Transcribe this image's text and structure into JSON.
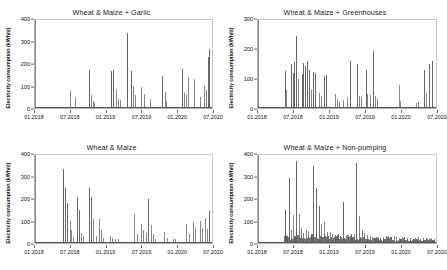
{
  "figure": {
    "background_color": "#ffffff",
    "series_color": "#5e5e5e",
    "axis_color": "#666666",
    "panel_count": 4
  },
  "chart_data": [
    {
      "type": "bar",
      "panel": "top-left",
      "title": "Wheat & Maize + Garlic",
      "xlabel": "",
      "ylabel": "Electricity consumption (kWh/d)",
      "ylim": [
        0,
        400
      ],
      "yticks": [
        0,
        100,
        200,
        300,
        400
      ],
      "xticks": [
        "01.2018",
        "07.2018",
        "01.2019",
        "07.2019",
        "01.2020",
        "07.2020"
      ],
      "xlim": [
        "01.2018",
        "07.2020"
      ],
      "grid": false,
      "legend": "none",
      "x": [
        0.195,
        0.225,
        0.307,
        0.318,
        0.33,
        0.335,
        0.43,
        0.441,
        0.455,
        0.47,
        0.478,
        0.52,
        0.545,
        0.556,
        0.567,
        0.6,
        0.613,
        0.65,
        0.72,
        0.733,
        0.74,
        0.83,
        0.84,
        0.852,
        0.862,
        0.9,
        0.93,
        0.955,
        0.965,
        0.975,
        0.985
      ],
      "values": [
        78,
        48,
        171,
        60,
        30,
        22,
        167,
        172,
        88,
        40,
        35,
        341,
        170,
        100,
        60,
        96,
        62,
        40,
        144,
        72,
        30,
        178,
        70,
        58,
        140,
        134,
        48,
        100,
        80,
        232,
        268
      ]
    },
    {
      "type": "bar",
      "panel": "top-right",
      "title": "Wheat & Maize + Greenhouses",
      "xlabel": "",
      "ylabel": "Electricity consumption (kWh/d)",
      "ylim": [
        0,
        300
      ],
      "yticks": [
        0,
        100,
        200,
        300
      ],
      "xticks": [
        "01.2018",
        "07.2018",
        "01.2019",
        "07.2019",
        "01.2020",
        "07.2020"
      ],
      "xlim": [
        "01.2018",
        "07.2020"
      ],
      "grid": false,
      "legend": "none",
      "x": [
        0.15,
        0.16,
        0.185,
        0.195,
        0.205,
        0.215,
        0.225,
        0.245,
        0.255,
        0.262,
        0.275,
        0.285,
        0.295,
        0.31,
        0.32,
        0.345,
        0.355,
        0.37,
        0.38,
        0.43,
        0.445,
        0.455,
        0.48,
        0.5,
        0.515,
        0.555,
        0.565,
        0.58,
        0.605,
        0.615,
        0.63,
        0.645,
        0.66,
        0.67,
        0.79,
        0.8,
        0.89,
        0.9,
        0.93,
        0.945,
        0.96,
        0.975
      ],
      "values": [
        126,
        60,
        150,
        120,
        158,
        244,
        100,
        116,
        152,
        144,
        160,
        128,
        60,
        124,
        118,
        52,
        40,
        110,
        114,
        48,
        30,
        22,
        28,
        36,
        160,
        150,
        40,
        36,
        130,
        48,
        44,
        196,
        40,
        30,
        78,
        24,
        18,
        20,
        128,
        50,
        150,
        160
      ]
    },
    {
      "type": "bar",
      "panel": "bottom-left",
      "title": "Wheat & Maize",
      "xlabel": "",
      "ylabel": "Electricity consumption (kWh/d)",
      "ylim": [
        0,
        400
      ],
      "yticks": [
        0,
        100,
        200,
        300,
        400
      ],
      "xticks": [
        "01.2018",
        "07.2018",
        "01.2019",
        "07.2019",
        "01.2020",
        "07.2020"
      ],
      "xlim": [
        "01.2018",
        "07.2020"
      ],
      "grid": false,
      "legend": "none",
      "x": [
        0.16,
        0.168,
        0.178,
        0.195,
        0.205,
        0.215,
        0.24,
        0.25,
        0.262,
        0.272,
        0.305,
        0.315,
        0.325,
        0.345,
        0.36,
        0.372,
        0.385,
        0.425,
        0.435,
        0.45,
        0.47,
        0.56,
        0.578,
        0.6,
        0.612,
        0.625,
        0.64,
        0.655,
        0.668,
        0.68,
        0.73,
        0.745,
        0.78,
        0.79,
        0.855,
        0.87,
        0.89,
        0.905,
        0.93,
        0.945,
        0.96,
        0.972,
        0.985
      ],
      "values": [
        336,
        250,
        180,
        98,
        60,
        28,
        208,
        150,
        44,
        30,
        252,
        210,
        108,
        30,
        110,
        60,
        22,
        30,
        25,
        20,
        18,
        130,
        40,
        88,
        60,
        45,
        202,
        80,
        40,
        20,
        52,
        24,
        20,
        16,
        86,
        40,
        96,
        66,
        98,
        70,
        112,
        62,
        146
      ]
    },
    {
      "type": "area",
      "panel": "bottom-right",
      "title": "Wheat & Maize + Non-pumping",
      "xlabel": "",
      "ylabel": "Electricity consumption (kWh/d)",
      "ylim": [
        0,
        400
      ],
      "yticks": [
        0,
        100,
        200,
        300,
        400
      ],
      "xticks": [
        "01.2018",
        "07.2018",
        "01.2019",
        "07.2019",
        "01.2020",
        "07.2020"
      ],
      "xlim": [
        "01.2018",
        "07.2020"
      ],
      "grid": false,
      "legend": "none",
      "baseline_note": "continuous low-level consumption approx 5-40 kWh/d from mid-2018 onward",
      "x": [
        0.15,
        0.16,
        0.172,
        0.185,
        0.198,
        0.212,
        0.228,
        0.24,
        0.252,
        0.268,
        0.282,
        0.296,
        0.31,
        0.324,
        0.34,
        0.356,
        0.372,
        0.388,
        0.402,
        0.418,
        0.432,
        0.448,
        0.462,
        0.478,
        0.492,
        0.508,
        0.522,
        0.538,
        0.552,
        0.568,
        0.582,
        0.598,
        0.612,
        0.628,
        0.642,
        0.658,
        0.672,
        0.688,
        0.702,
        0.718,
        0.732,
        0.748,
        0.762,
        0.778,
        0.792,
        0.808,
        0.822,
        0.838,
        0.852,
        0.868,
        0.882,
        0.898,
        0.912,
        0.928,
        0.942,
        0.958,
        0.972,
        0.986
      ],
      "values": [
        150,
        36,
        296,
        60,
        128,
        374,
        130,
        70,
        44,
        60,
        56,
        40,
        350,
        250,
        168,
        88,
        96,
        52,
        48,
        40,
        36,
        40,
        34,
        186,
        30,
        36,
        32,
        40,
        364,
        124,
        60,
        44,
        36,
        30,
        26,
        24,
        28,
        22,
        26,
        30,
        34,
        28,
        30,
        26,
        24,
        28,
        26,
        22,
        24,
        20,
        22,
        26,
        20,
        22,
        24,
        18,
        22,
        20
      ]
    }
  ]
}
